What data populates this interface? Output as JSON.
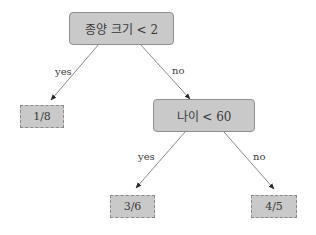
{
  "diagram": {
    "type": "decision-tree",
    "colors": {
      "node_fill": "#c9c9c9",
      "node_border": "#8f8f8f",
      "edge": "#8a8a8a",
      "text": "#3a3a3a"
    },
    "nodes": {
      "root": {
        "label": "종양 크기 < 2",
        "kind": "decision"
      },
      "leaf_left": {
        "label": "1/8",
        "kind": "leaf"
      },
      "age": {
        "label": "나이 < 60",
        "kind": "decision"
      },
      "leaf_mid": {
        "label": "3/6",
        "kind": "leaf"
      },
      "leaf_right": {
        "label": "4/5",
        "kind": "leaf"
      }
    },
    "edges": [
      {
        "from": "root",
        "to": "leaf_left",
        "label": "yes"
      },
      {
        "from": "root",
        "to": "age",
        "label": "no"
      },
      {
        "from": "age",
        "to": "leaf_mid",
        "label": "yes"
      },
      {
        "from": "age",
        "to": "leaf_right",
        "label": "no"
      }
    ]
  }
}
